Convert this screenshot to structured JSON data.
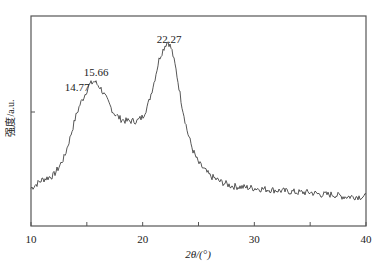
{
  "chart_data": {
    "type": "line",
    "title": "",
    "xlabel": "2θ/(°)",
    "ylabel": "强度/a.u.",
    "xlim": [
      10,
      40
    ],
    "ylim": [
      0,
      100
    ],
    "xticks": [
      10,
      20,
      30,
      40
    ],
    "xminor_ticks": [
      15,
      25,
      35
    ],
    "grid": false,
    "legend": null,
    "series": [
      {
        "name": "XRD pattern",
        "x": [
          10,
          11,
          12,
          12.5,
          13,
          13.5,
          14,
          14.4,
          14.77,
          15.2,
          15.66,
          16.2,
          16.8,
          17.4,
          18,
          18.5,
          19,
          19.5,
          20,
          20.5,
          21,
          21.5,
          22,
          22.27,
          22.6,
          23,
          23.5,
          24,
          24.5,
          25,
          26,
          27,
          28,
          30,
          32,
          34,
          35,
          36,
          37,
          38,
          39,
          40
        ],
        "values": [
          18,
          22,
          24,
          28,
          33,
          42,
          52,
          58,
          62,
          67,
          69,
          66,
          60,
          54,
          51,
          50,
          50,
          50,
          52,
          58,
          68,
          80,
          86,
          88,
          84,
          74,
          58,
          45,
          36,
          30,
          24,
          21,
          19,
          18,
          17,
          16,
          16,
          15,
          15,
          14,
          14,
          14
        ]
      }
    ],
    "annotations": [
      {
        "text": "14.77",
        "x": 14.77
      },
      {
        "text": "15.66",
        "x": 15.66
      },
      {
        "text": "22.27",
        "x": 22.27
      }
    ]
  },
  "axes": {
    "x_tick_labels": [
      "10",
      "20",
      "30",
      "40"
    ],
    "x_label": "2θ/(°)",
    "y_label": "强度/a.u."
  },
  "annotations": {
    "peak1": "14.77",
    "peak2": "15.66",
    "peak3": "22.27"
  }
}
